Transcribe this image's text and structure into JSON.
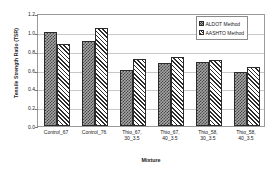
{
  "chart_data": {
    "type": "bar",
    "title": "",
    "xlabel": "Mixture",
    "ylabel": "Tensile Strength Ratio (TSR)",
    "ylim": [
      0.0,
      1.2
    ],
    "ytick_labels": [
      "1.2",
      "1.0",
      "0.8",
      "0.6",
      "0.4",
      "0.2",
      "0.0"
    ],
    "ytick_values": [
      1.2,
      1.0,
      0.8,
      0.6,
      0.4,
      0.2,
      0.0
    ],
    "grid": true,
    "legend_position": "top-right",
    "categories": [
      "Control_67",
      "Control_76",
      "Thio_67,\n30_3.5",
      "Thio_67,\n40_3.5",
      "Thio_58,\n30_3.5",
      "Thio_58,\n40_3.5"
    ],
    "category_lines": [
      [
        "Control_67"
      ],
      [
        "Control_76"
      ],
      [
        "Thio_67,",
        "30_3.5"
      ],
      [
        "Thio_67,",
        "40_3.5"
      ],
      [
        "Thio_58,",
        "30_3.5"
      ],
      [
        "Thio_58,",
        "40_3.5"
      ]
    ],
    "series": [
      {
        "name": "ALDOT Method",
        "pattern": "checkered-gray",
        "color": "#a8a8a8",
        "values": [
          1.0,
          0.9,
          0.59,
          0.67,
          0.68,
          0.57
        ]
      },
      {
        "name": "AASHTO Method",
        "pattern": "diagonal-hatch",
        "color": "#ffffff",
        "values": [
          0.87,
          1.04,
          0.71,
          0.73,
          0.7,
          0.63
        ]
      }
    ]
  }
}
